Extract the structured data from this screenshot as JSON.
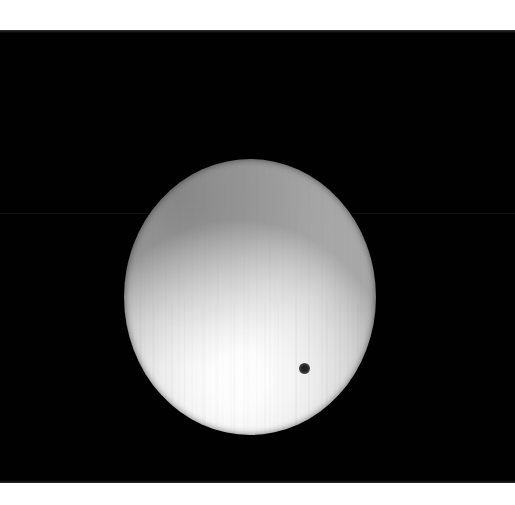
{
  "image": {
    "subject": "solar-disk-with-planetary-transit",
    "description": "Black-and-white astronomical photograph of the Sun's disk with a small dark planetary silhouette in transit",
    "canvas": {
      "width": 515,
      "height": 505
    },
    "background_color": "#ffffff"
  },
  "frame": {
    "name": "photographic-frame",
    "color": "#000000",
    "left": 0,
    "top": 30,
    "width": 515,
    "height": 453
  },
  "artifacts": {
    "scanline_seam": {
      "y": 213,
      "color": "#141414"
    },
    "vertical_striping": "faint vertical CCD column striping across the solar disk",
    "grain": "fine photographic grain over the whole frame"
  },
  "solar_disk": {
    "name": "solar-disk",
    "center_x": 250,
    "center_y": 297,
    "radius_x": 126,
    "radius_y": 138,
    "core_color": "#ffffff",
    "limb_color": "#a8a8a8",
    "brightest_point": {
      "x": 238,
      "y": 372
    },
    "limb_darkening": "upper-left quadrant noticeably greyer than lower-left core"
  },
  "transit_dot": {
    "name": "transiting-planet-silhouette",
    "center_x": 304,
    "center_y": 368,
    "diameter": 11,
    "color": "#1d1d1d"
  }
}
